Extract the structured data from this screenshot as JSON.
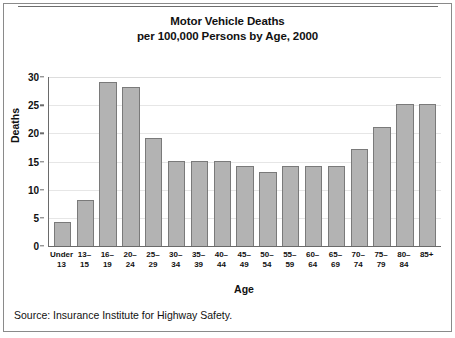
{
  "figure": {
    "title_line1": "Motor Vehicle Deaths",
    "title_line2": "per 100,000 Persons by Age, 2000",
    "source": "Source: Insurance Institute for Highway Safety.",
    "bar_fill": "#b3b3b3",
    "bar_stroke": "#7a7a7a",
    "axis_color": "#6a6a6a",
    "grid_color": "#e6e6e6",
    "frame_color": "#8a8a8a"
  },
  "chart_data": {
    "type": "bar",
    "title": "Motor Vehicle Deaths per 100,000 Persons by Age, 2000",
    "xlabel": "Age",
    "ylabel": "Deaths",
    "ylim": [
      0,
      30
    ],
    "yticks": [
      0,
      5,
      10,
      15,
      20,
      25,
      30
    ],
    "grid": true,
    "legend": false,
    "categories": [
      "Under 13",
      "13–15",
      "16–19",
      "20–24",
      "25–29",
      "30–34",
      "35–39",
      "40–44",
      "45–49",
      "50–54",
      "55–59",
      "60–64",
      "65–69",
      "70–74",
      "75–79",
      "80–84",
      "85+"
    ],
    "category_lines": [
      [
        "Under",
        "13"
      ],
      [
        "13–",
        "15"
      ],
      [
        "16–",
        "19"
      ],
      [
        "20–",
        "24"
      ],
      [
        "25–",
        "29"
      ],
      [
        "30–",
        "34"
      ],
      [
        "35–",
        "39"
      ],
      [
        "40–",
        "44"
      ],
      [
        "45–",
        "49"
      ],
      [
        "50–",
        "54"
      ],
      [
        "55–",
        "59"
      ],
      [
        "60–",
        "64"
      ],
      [
        "65–",
        "69"
      ],
      [
        "70–",
        "74"
      ],
      [
        "75–",
        "79"
      ],
      [
        "80–",
        "84"
      ],
      [
        "85+",
        ""
      ]
    ],
    "values": [
      4.3,
      8.2,
      29.2,
      28.2,
      19.2,
      15.1,
      15.1,
      15.1,
      14.2,
      13.2,
      14.2,
      14.2,
      14.2,
      17.2,
      21.2,
      25.2,
      25.2
    ]
  }
}
